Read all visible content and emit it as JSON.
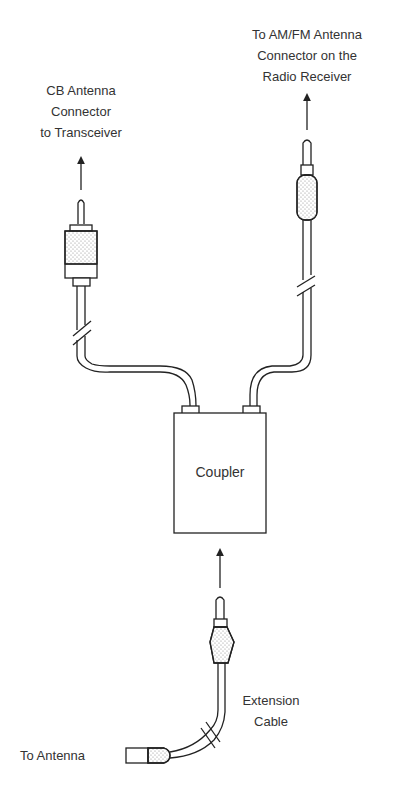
{
  "diagram": {
    "labels": {
      "cb_connector": [
        "CB Antenna",
        "Connector",
        "to Transceiver"
      ],
      "amfm_connector": [
        "To AM/FM Antenna",
        "Connector on the",
        "Radio Receiver"
      ],
      "coupler": "Coupler",
      "extension_cable": [
        "Extension",
        "Cable"
      ],
      "to_antenna": "To Antenna"
    },
    "components": [
      {
        "id": "cb-plug",
        "type": "PL-259 style connector",
        "leads_to": "CB Antenna Connector to Transceiver"
      },
      {
        "id": "amfm-plug",
        "type": "Motorola style plug",
        "leads_to": "AM/FM Antenna Connector on the Radio Receiver"
      },
      {
        "id": "coupler",
        "type": "box",
        "label": "Coupler"
      },
      {
        "id": "extension-plug",
        "type": "Motorola style plug",
        "leads_to": "Coupler"
      },
      {
        "id": "antenna-jack",
        "type": "jack",
        "label": "To Antenna"
      }
    ],
    "colors": {
      "line": "#222222",
      "stipple": "#888888",
      "text": "#333333",
      "background": "#ffffff"
    }
  }
}
